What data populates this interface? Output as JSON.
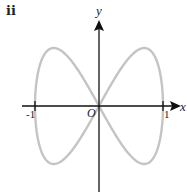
{
  "figure": {
    "part_label": "ii",
    "axes": {
      "x_label": "x",
      "y_label": "y",
      "origin_label": "O",
      "x_ticks": [
        {
          "value": -1,
          "label": "-1"
        },
        {
          "value": 1,
          "label": "1"
        }
      ],
      "axis_color": "#111111"
    },
    "curve": {
      "description": "figure-eight closed curve through origin, crossing x-axis at -1, 0 and 1",
      "parametric": "x = cos t, y = sin 2t",
      "y_extent": [
        -0.9,
        0.9
      ],
      "x_extent": [
        -1,
        1
      ],
      "color": "#c4c4c4"
    }
  }
}
